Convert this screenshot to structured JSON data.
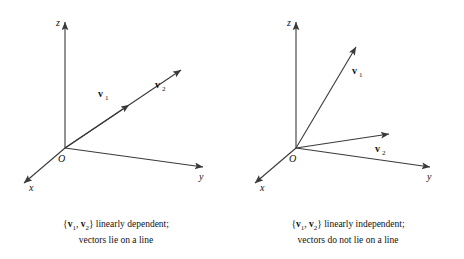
{
  "figure": {
    "panels": [
      {
        "id": "linearly-dependent",
        "axes": {
          "x": "x",
          "y": "y",
          "z": "z",
          "origin": "O"
        },
        "vectors": [
          {
            "name": "v1",
            "label_main": "v",
            "label_sub": "1"
          },
          {
            "name": "v2",
            "label_main": "v",
            "label_sub": "2"
          }
        ],
        "caption": {
          "line1_prefix": "{",
          "line1_v1_main": "v",
          "line1_v1_sub": "1",
          "line1_sep": ", ",
          "line1_v2_main": "v",
          "line1_v2_sub": "2",
          "line1_suffix": "} linearly dependent;",
          "line2": "vectors lie on a line"
        }
      },
      {
        "id": "linearly-independent",
        "axes": {
          "x": "x",
          "y": "y",
          "z": "z",
          "origin": "O"
        },
        "vectors": [
          {
            "name": "v1",
            "label_main": "v",
            "label_sub": "1"
          },
          {
            "name": "v2",
            "label_main": "v",
            "label_sub": "2"
          }
        ],
        "caption": {
          "line1_prefix": "{",
          "line1_v1_main": "v",
          "line1_v1_sub": "1",
          "line1_sep": ", ",
          "line1_v2_main": "v",
          "line1_v2_sub": "2",
          "line1_suffix": "} linearly independent;",
          "line2": "vectors do not lie on a line"
        }
      }
    ],
    "style": {
      "line_color": "#3a3a3a",
      "text_color": "#111111",
      "background": "#ffffff"
    }
  }
}
